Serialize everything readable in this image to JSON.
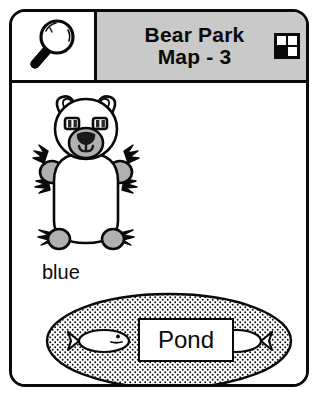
{
  "card": {
    "header": {
      "search_icon": "magnifier-icon",
      "title_line_1": "Bear Park",
      "title_line_2": "Map - 3",
      "grid_icon": "quadrant-grid-icon",
      "grid_cells": [
        "white",
        "white",
        "black",
        "white"
      ],
      "background_color": "#c9c9c9"
    },
    "map": {
      "figures": [
        {
          "name": "bear",
          "icon": "bear-figure",
          "label": "blue",
          "body_fill": "#ffffff",
          "paw_fill": "#b0b0b0",
          "outline_color": "#0a0a0a"
        },
        {
          "name": "pond",
          "icon": "pond-ellipse",
          "label": "Pond",
          "fill_pattern": "stipple",
          "outline_color": "#0a0a0a",
          "fish_count": 2,
          "fish": [
            {
              "name": "fish-left",
              "facing": "right"
            },
            {
              "name": "fish-right",
              "facing": "left"
            }
          ]
        }
      ]
    }
  }
}
